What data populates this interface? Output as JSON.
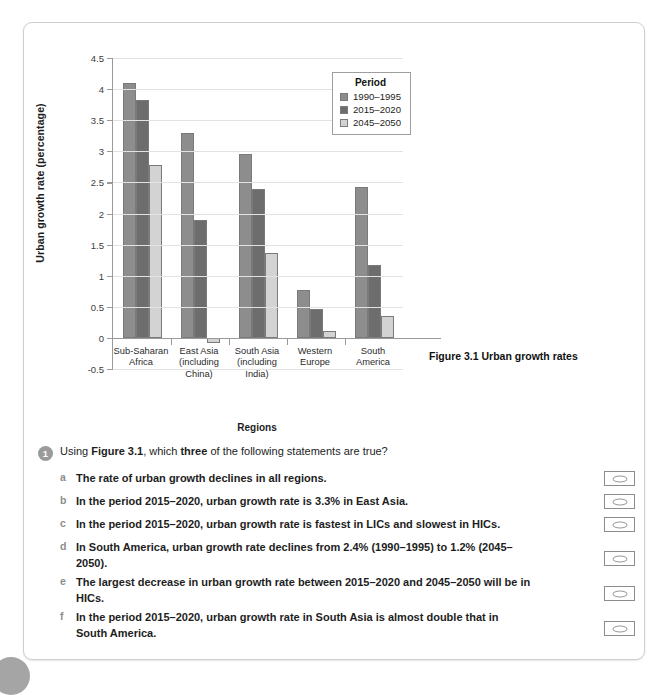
{
  "chart_data": {
    "type": "bar",
    "title": "Figure 3.1 Urban growth rates",
    "xlabel": "Regions",
    "ylabel": "Urban growth rate (percentage)",
    "ylim": [
      -0.5,
      4.5
    ],
    "ytick_labels": [
      "4.5",
      "4",
      "3.5",
      "3",
      "2.5",
      "2",
      "1.5",
      "1",
      "0.5",
      "0",
      "-0.5"
    ],
    "ytick_values": [
      4.5,
      4,
      3.5,
      3,
      2.5,
      2,
      1.5,
      1,
      0.5,
      0,
      -0.5
    ],
    "grid": true,
    "legend_title": "Period",
    "legend_position": "top-right",
    "categories": [
      "Sub-Saharan Africa",
      "East Asia (including China)",
      "South Asia (including India)",
      "Western Europe",
      "South America"
    ],
    "category_lines": [
      [
        "Sub-Saharan",
        "Africa"
      ],
      [
        "East Asia",
        "(including",
        "China)"
      ],
      [
        "South Asia",
        "(including",
        "India)"
      ],
      [
        "Western",
        "Europe"
      ],
      [
        "South",
        "America"
      ]
    ],
    "series": [
      {
        "name": "1990–1995",
        "color": "#8d8d8d",
        "values": [
          4.1,
          3.3,
          2.95,
          0.77,
          2.42
        ]
      },
      {
        "name": "2015–2020",
        "color": "#6d6d6d",
        "values": [
          3.83,
          1.9,
          2.4,
          0.47,
          1.17
        ]
      },
      {
        "name": "2045–2050",
        "color": "#d3d3d3",
        "values": [
          2.78,
          -0.08,
          1.36,
          0.11,
          0.35
        ]
      }
    ]
  },
  "figure": {
    "caption": "Figure 3.1 Urban growth rates"
  },
  "question": {
    "number": "1",
    "prompt_part1": "Using ",
    "prompt_bold1": "Figure 3.1",
    "prompt_part2": ", which ",
    "prompt_bold2": "three",
    "prompt_part3": " of the following statements are true?",
    "options": [
      {
        "letter": "a",
        "text": "The rate of urban growth declines in all regions."
      },
      {
        "letter": "b",
        "text": "In the period 2015–2020, urban growth rate is 3.3% in East Asia."
      },
      {
        "letter": "c",
        "text": "In the period 2015–2020, urban growth rate is fastest in LICs and slowest in HICs."
      },
      {
        "letter": "d",
        "text": "In South America, urban growth rate declines from 2.4% (1990–1995) to 1.2% (2045–2050)."
      },
      {
        "letter": "e",
        "text": "The largest decrease in urban growth rate between 2015–2020 and 2045–2050 will be in HICs."
      },
      {
        "letter": "f",
        "text": "In the period 2015–2020, urban growth rate in South Asia is almost double that in South America."
      }
    ]
  }
}
